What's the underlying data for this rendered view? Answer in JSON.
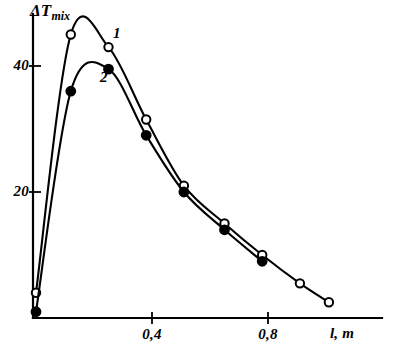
{
  "chart_data": {
    "type": "line",
    "title": "",
    "subtitle": "",
    "ylabel": "ΔT",
    "ylabel_subscript": "mix",
    "xlabel": "l, m",
    "xlim": [
      0,
      1.1
    ],
    "ylim": [
      0,
      50
    ],
    "grid": false,
    "legend_position": "inline-annotations",
    "xticks": [
      0.4,
      0.8
    ],
    "xtick_labels": [
      "0,4",
      "0,8"
    ],
    "yticks": [
      20,
      40
    ],
    "ytick_labels": [
      "20",
      "40"
    ],
    "annotations": [
      {
        "text": "1",
        "x": 0.28,
        "y": 47.5,
        "marker": "open-circle"
      },
      {
        "text": "2",
        "x": 0.235,
        "y": 40.0,
        "marker": "filled-circle"
      }
    ],
    "series": [
      {
        "name": "1",
        "marker": "open-circle",
        "color": "#000000",
        "x": [
          0.0,
          0.12,
          0.25,
          0.38,
          0.51,
          0.65,
          0.78,
          0.91,
          1.01
        ],
        "y": [
          4.0,
          45.0,
          43.0,
          31.5,
          21.0,
          15.0,
          10.0,
          5.5,
          2.5
        ]
      },
      {
        "name": "2",
        "marker": "filled-circle",
        "color": "#000000",
        "x": [
          0.0,
          0.12,
          0.25,
          0.38,
          0.51,
          0.65,
          0.78
        ],
        "y": [
          1.0,
          36.0,
          39.5,
          29.0,
          20.0,
          14.0,
          9.0
        ]
      }
    ]
  },
  "axes": {
    "y_axis_label_main": "ΔT",
    "y_axis_label_sub": "mix",
    "x_axis_label": "l, m",
    "tick_40": "40",
    "tick_20": "20",
    "tick_04": "0,4",
    "tick_08": "0,8"
  },
  "curve_labels": {
    "one": "1",
    "two": "2"
  },
  "colors": {
    "ink": "#000000",
    "paper": "#ffffff"
  }
}
